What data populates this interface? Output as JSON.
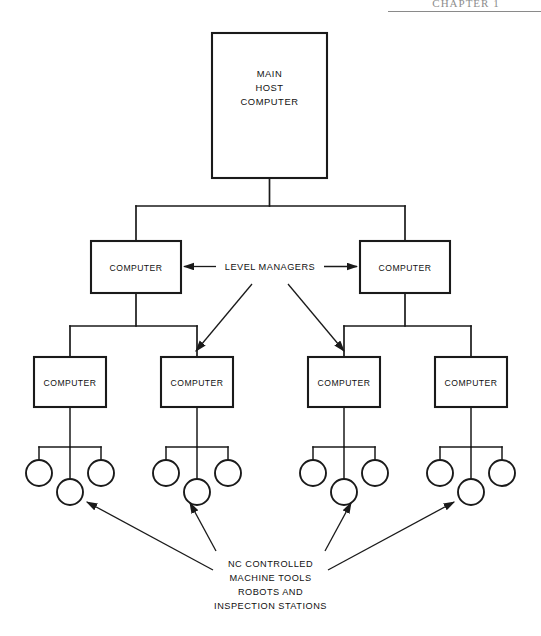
{
  "page": {
    "header_text": "CHAPTER 1",
    "width": 541,
    "height": 636,
    "background": "#ffffff",
    "ink_color": "#1a1a1a"
  },
  "diagram": {
    "root": {
      "label_line1": "MAIN",
      "label_line2": "HOST",
      "label_line3": "COMPUTER"
    },
    "level_managers": {
      "annotation": "LEVEL MANAGERS"
    },
    "level2": [
      {
        "label": "COMPUTER"
      },
      {
        "label": "COMPUTER"
      }
    ],
    "level3": [
      {
        "label": "COMPUTER"
      },
      {
        "label": "COMPUTER"
      },
      {
        "label": "COMPUTER"
      },
      {
        "label": "COMPUTER"
      }
    ],
    "leaf_caption": {
      "line1": "NC CONTROLLED",
      "line2": "MACHINE TOOLS",
      "line3": "ROBOTS AND",
      "line4": "INSPECTION STATIONS"
    },
    "leaf_groups": [
      {
        "circles": 3
      },
      {
        "circles": 3
      },
      {
        "circles": 3
      },
      {
        "circles": 3
      }
    ]
  }
}
